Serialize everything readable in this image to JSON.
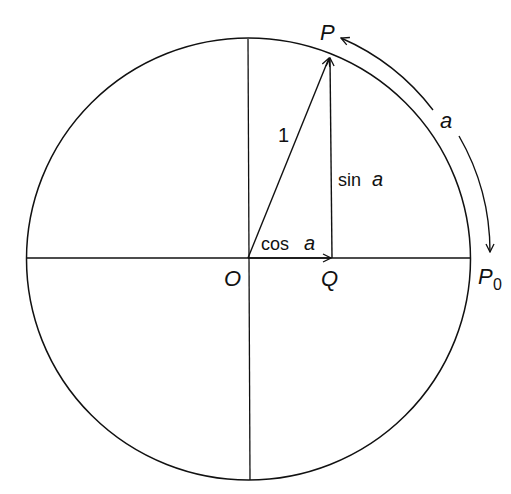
{
  "diagram": {
    "type": "unit-circle",
    "labels": {
      "origin": "O",
      "point_p": "P",
      "point_q": "Q",
      "point_p0": "P",
      "point_p0_subscript": "0",
      "radius": "1",
      "sine": "sin",
      "cosine": "cos",
      "angle": "a",
      "arc": "a"
    },
    "colors": {
      "stroke": "#111111",
      "background": "#ffffff"
    }
  }
}
